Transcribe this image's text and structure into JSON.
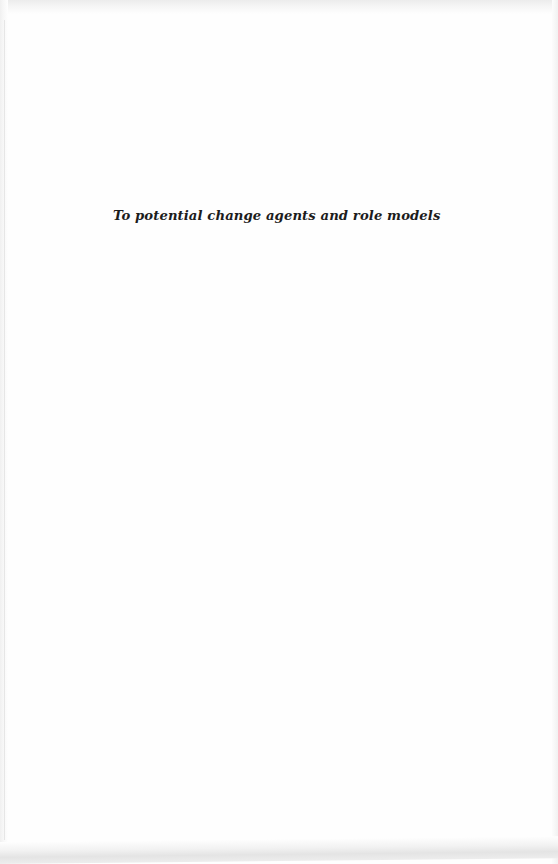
{
  "page": {
    "type": "dedication",
    "dedication_text": "To potential change agents and role models"
  },
  "colors": {
    "paper": "#fefefe",
    "text": "#1c1c1c",
    "edge_shadow": "#e4e4e4"
  }
}
